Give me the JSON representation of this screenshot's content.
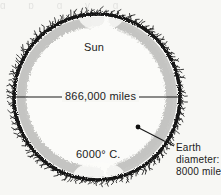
{
  "figure": {
    "background_color": "#f7f7f4",
    "ink_color": "#111111",
    "shading_color": "#b0b0ad",
    "sun_label": "Sun",
    "diameter_label": "866,000 miles",
    "temperature_label": "6000° C.",
    "earth_callout": {
      "line1": "Earth",
      "line2": "diameter:",
      "line3": "8000 miles"
    },
    "cropped_text_above": "g  p      g    y  g",
    "geometry": {
      "center_x": 97,
      "center_y": 97,
      "radius": 84,
      "diameter_line_y": 97,
      "diameter_line_x1": 13,
      "diameter_line_x2": 181,
      "earth_dot_x": 138,
      "earth_dot_y": 127,
      "earth_dot_radius": 2.3,
      "leader_x2": 174,
      "leader_y2": 146
    }
  },
  "chart_data": {
    "type": "diagram",
    "title": "Sun",
    "annotations": [
      {
        "label": "Sun",
        "kind": "body-name"
      },
      {
        "label": "866,000 miles",
        "kind": "diameter",
        "value": 866000,
        "unit": "miles",
        "target": "Sun"
      },
      {
        "label": "6000° C.",
        "kind": "temperature",
        "value": 6000,
        "unit": "degrees Celsius",
        "target": "Sun"
      },
      {
        "label": "Earth diameter: 8000 miles",
        "kind": "diameter",
        "value": 8000,
        "unit": "miles",
        "target": "Earth"
      }
    ]
  }
}
